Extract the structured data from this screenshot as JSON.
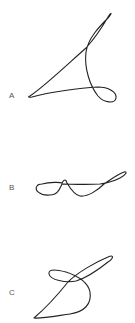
{
  "figures": [
    {
      "id": "A",
      "label": "A",
      "description": "closed knotted curve with upper narrow loop and lower-right loop"
    },
    {
      "id": "B",
      "label": "B",
      "description": "horizontal closed curve with left loop, central bump and right loop"
    },
    {
      "id": "C",
      "label": "C",
      "description": "diagonal closed curve with elongated upper-right lobe and small left loop"
    }
  ],
  "colors": {
    "stroke": "#222222",
    "label": "#555555",
    "background": "#ffffff"
  }
}
